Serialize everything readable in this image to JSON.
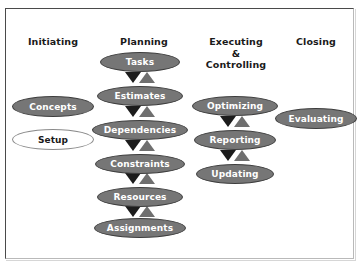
{
  "diagram": {
    "type": "process-flow",
    "background_color": "#ffffff",
    "node_fill_color": "#767676",
    "node_text_color": "#ffffff",
    "node_border_color": "#3d3d3d",
    "arrow_down_color": "#1c1c1c",
    "arrow_up_color": "#6f6f6f",
    "frame_border_color": "#4a4a4a"
  },
  "columns": [
    {
      "id": "initiating",
      "header": "Initiating",
      "header_x": 22,
      "header_y": 36,
      "header_width": 62,
      "nodes": [
        {
          "label": "Concepts",
          "style": "filled",
          "x": 12,
          "y": 96,
          "w": 82,
          "h": 21
        },
        {
          "label": "Setup",
          "style": "hollow",
          "x": 12,
          "y": 129,
          "w": 82,
          "h": 21
        }
      ],
      "arrows": []
    },
    {
      "id": "planning",
      "header": "Planning",
      "header_x": 113,
      "header_y": 36,
      "header_width": 62,
      "nodes": [
        {
          "label": "Tasks",
          "style": "filled",
          "x": 100,
          "y": 52,
          "w": 80,
          "h": 20
        },
        {
          "label": "Estimates",
          "style": "filled",
          "x": 97,
          "y": 86,
          "w": 86,
          "h": 20
        },
        {
          "label": "Dependencies",
          "style": "filled",
          "x": 92,
          "y": 120,
          "w": 96,
          "h": 20
        },
        {
          "label": "Constraints",
          "style": "filled",
          "x": 95,
          "y": 154,
          "w": 90,
          "h": 20
        },
        {
          "label": "Resources",
          "style": "filled",
          "x": 97,
          "y": 187,
          "w": 86,
          "h": 20
        },
        {
          "label": "Assignments",
          "style": "filled",
          "x": 94,
          "y": 218,
          "w": 92,
          "h": 20
        }
      ],
      "arrows": [
        {
          "x": 125,
          "y": 72
        },
        {
          "x": 125,
          "y": 106
        },
        {
          "x": 125,
          "y": 140
        },
        {
          "x": 125,
          "y": 173
        },
        {
          "x": 125,
          "y": 206
        }
      ]
    },
    {
      "id": "executing-controlling",
      "header": "Executing\n&\nControlling",
      "header_x": 199,
      "header_y": 36,
      "header_width": 74,
      "nodes": [
        {
          "label": "Optimizing",
          "style": "filled",
          "x": 192,
          "y": 96,
          "w": 86,
          "h": 20
        },
        {
          "label": "Reporting",
          "style": "filled",
          "x": 194,
          "y": 130,
          "w": 82,
          "h": 20
        },
        {
          "label": "Updating",
          "style": "filled",
          "x": 196,
          "y": 164,
          "w": 78,
          "h": 20
        }
      ],
      "arrows": [
        {
          "x": 220,
          "y": 116
        },
        {
          "x": 220,
          "y": 150
        }
      ]
    },
    {
      "id": "closing",
      "header": "Closing",
      "header_x": 288,
      "header_y": 36,
      "header_width": 56,
      "nodes": [
        {
          "label": "Evaluating",
          "style": "filled",
          "x": 275,
          "y": 108,
          "w": 82,
          "h": 21
        }
      ],
      "arrows": []
    }
  ]
}
